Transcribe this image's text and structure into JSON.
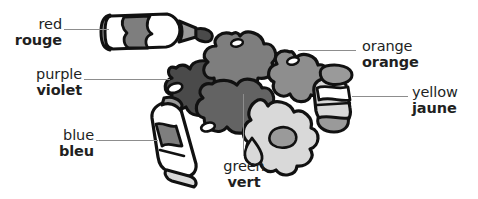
{
  "figure": {
    "palette": {
      "outline": "#111111",
      "leader_line": "#8d8d8d",
      "text": "#221f1f",
      "background": "#ffffff",
      "tone_white": "#ffffff",
      "tone_light": "#d9d9d9",
      "tone_mid": "#9a9a9a",
      "tone_dark": "#6e6e6e",
      "tone_darker": "#4a4a4a",
      "tone_darkest": "#2e2e2e"
    }
  },
  "labels": [
    {
      "key": "red",
      "en": "red",
      "fr": "rouge",
      "align": "right",
      "x": 4,
      "y": 16,
      "width": 58,
      "leader": {
        "type": "h",
        "x": 64,
        "y": 29,
        "length": 45
      }
    },
    {
      "key": "purple",
      "en": "purple",
      "fr": "violet",
      "align": "right",
      "x": 4,
      "y": 66,
      "width": 78,
      "leader": {
        "type": "h",
        "x": 84,
        "y": 79,
        "length": 86
      }
    },
    {
      "key": "blue",
      "en": "blue",
      "fr": "bleu",
      "align": "right",
      "x": 36,
      "y": 127,
      "width": 58,
      "leader": {
        "type": "h",
        "x": 96,
        "y": 140,
        "length": 62
      }
    },
    {
      "key": "orange",
      "en": "orange",
      "fr": "orange",
      "align": "left",
      "x": 362,
      "y": 38,
      "width": 76,
      "leader": {
        "type": "h",
        "x": 298,
        "y": 50,
        "length": 58
      }
    },
    {
      "key": "yellow",
      "en": "yellow",
      "fr": "jaune",
      "align": "left",
      "x": 412,
      "y": 84,
      "width": 64,
      "leader": {
        "type": "h",
        "x": 352,
        "y": 96,
        "length": 56
      }
    },
    {
      "key": "green",
      "en": "green",
      "fr": "vert",
      "align": "center",
      "x": 216,
      "y": 158,
      "width": 56,
      "leader": {
        "type": "v",
        "x": 243,
        "y": 94,
        "length": 62
      }
    }
  ],
  "art": {
    "name": "paint-tubes-and-blobs-illustration",
    "elements": [
      "red-paint-tube",
      "blue-paint-tube",
      "orange-paint-tube",
      "purple-paint-blob",
      "orange-paint-blob",
      "green-paint-blob",
      "yellow-paint-blob"
    ]
  }
}
